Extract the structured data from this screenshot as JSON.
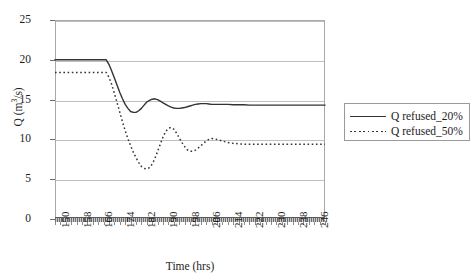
{
  "chart_data": {
    "type": "line",
    "title": "",
    "xlabel": "Time (hrs)",
    "ylabel": "Q (m3/s)",
    "ylabel_display": "Q (m",
    "ylabel_sup": "3",
    "ylabel_tail": "/s)",
    "xlim": [
      150,
      250
    ],
    "ylim": [
      0,
      25
    ],
    "yticks": [
      0,
      5,
      10,
      15,
      20,
      25
    ],
    "ytick_labels": [
      "0",
      "5",
      "10",
      "15",
      "20",
      "25"
    ],
    "xticks": [
      150,
      158,
      166,
      174,
      182,
      190,
      198,
      206,
      214,
      222,
      230,
      238,
      246
    ],
    "xtick_labels": [
      "150",
      "158",
      "166",
      "174",
      "182",
      "190",
      "198",
      "206",
      "214",
      "222",
      "230",
      "238",
      "246"
    ],
    "x_minor_step": 2,
    "grid": "horizontal",
    "legend_position": "right",
    "series": [
      {
        "name": "Q refused_20%",
        "style": "solid",
        "color": "#333333",
        "x": [
          150,
          152,
          154,
          156,
          158,
          160,
          162,
          164,
          166,
          168,
          169,
          170,
          171,
          172,
          173,
          174,
          175,
          176,
          177,
          178,
          179,
          180,
          181,
          182,
          183,
          184,
          185,
          186,
          187,
          188,
          189,
          190,
          191,
          192,
          193,
          194,
          195,
          196,
          197,
          198,
          199,
          200,
          201,
          202,
          203,
          204,
          205,
          206,
          207,
          208,
          210,
          212,
          214,
          216,
          218,
          220,
          222,
          226,
          230,
          234,
          238,
          242,
          246,
          250
        ],
        "y": [
          20.0,
          20.0,
          20.0,
          20.0,
          20.0,
          20.0,
          20.0,
          20.0,
          20.0,
          20.0,
          20.0,
          19.4,
          18.6,
          17.7,
          16.8,
          15.9,
          15.1,
          14.4,
          13.9,
          13.5,
          13.4,
          13.4,
          13.6,
          13.9,
          14.3,
          14.7,
          14.9,
          15.05,
          15.1,
          15.0,
          14.8,
          14.6,
          14.4,
          14.2,
          14.05,
          13.95,
          13.9,
          13.9,
          13.95,
          14.0,
          14.1,
          14.2,
          14.3,
          14.4,
          14.45,
          14.5,
          14.5,
          14.5,
          14.45,
          14.4,
          14.4,
          14.4,
          14.4,
          14.35,
          14.35,
          14.35,
          14.3,
          14.3,
          14.3,
          14.3,
          14.3,
          14.3,
          14.3,
          14.3
        ]
      },
      {
        "name": "Q refused_50%",
        "style": "dotted",
        "color": "#333333",
        "x": [
          150,
          152,
          154,
          156,
          158,
          160,
          162,
          164,
          166,
          168,
          169,
          170,
          171,
          172,
          173,
          174,
          175,
          176,
          177,
          178,
          179,
          180,
          181,
          182,
          183,
          184,
          185,
          186,
          187,
          188,
          189,
          190,
          191,
          192,
          193,
          194,
          195,
          196,
          197,
          198,
          199,
          200,
          201,
          202,
          203,
          204,
          205,
          206,
          207,
          208,
          210,
          212,
          214,
          216,
          218,
          220,
          222,
          226,
          230,
          234,
          238,
          242,
          246,
          250
        ],
        "y": [
          18.4,
          18.4,
          18.4,
          18.4,
          18.4,
          18.4,
          18.4,
          18.4,
          18.4,
          18.4,
          18.4,
          17.8,
          16.9,
          15.8,
          14.6,
          13.4,
          12.2,
          11.1,
          10.1,
          9.2,
          8.4,
          7.7,
          7.1,
          6.6,
          6.35,
          6.3,
          6.45,
          6.9,
          7.6,
          8.5,
          9.4,
          10.3,
          11.0,
          11.4,
          11.5,
          11.3,
          10.8,
          10.2,
          9.6,
          9.1,
          8.7,
          8.5,
          8.5,
          8.65,
          8.9,
          9.2,
          9.5,
          9.8,
          10.0,
          10.1,
          10.0,
          9.8,
          9.6,
          9.5,
          9.45,
          9.4,
          9.4,
          9.4,
          9.4,
          9.4,
          9.4,
          9.4,
          9.4,
          9.4
        ]
      }
    ]
  },
  "legend": {
    "items": [
      {
        "label": "Q refused_20%",
        "style": "solid"
      },
      {
        "label": "Q refused_50%",
        "style": "dotted"
      }
    ]
  }
}
